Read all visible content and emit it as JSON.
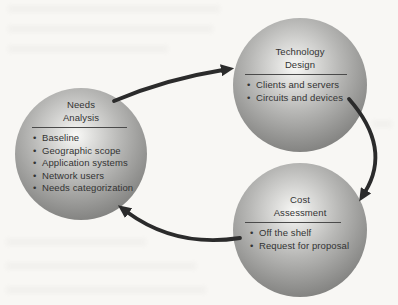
{
  "figure": {
    "name": "Network design process cycle diagram",
    "background": "#f8f7f4"
  },
  "diagram": {
    "type": "cycle",
    "nodes": [
      {
        "id": "needs-analysis",
        "title": [
          "Needs",
          "Analysis"
        ],
        "bullets": [
          "Baseline",
          "Geographic scope",
          "Application systems",
          "Network users",
          "Needs categorization"
        ]
      },
      {
        "id": "technology-design",
        "title": [
          "Technology",
          "Design"
        ],
        "bullets": [
          "Clients and servers",
          "Circuits and devices"
        ]
      },
      {
        "id": "cost-assessment",
        "title": [
          "Cost",
          "Assessment"
        ],
        "bullets": [
          "Off the shelf",
          "Request for proposal"
        ]
      }
    ],
    "arrows": [
      {
        "from": "needs-analysis",
        "to": "technology-design"
      },
      {
        "from": "technology-design",
        "to": "cost-assessment"
      },
      {
        "from": "cost-assessment",
        "to": "needs-analysis"
      }
    ],
    "colors": {
      "sphere_highlight": "#f9f9f7",
      "sphere_edge": "#696967",
      "arrow": "#2b2b2b",
      "text": "#333333",
      "divider": "#4a4a4a",
      "background": "#f8f7f4"
    }
  }
}
